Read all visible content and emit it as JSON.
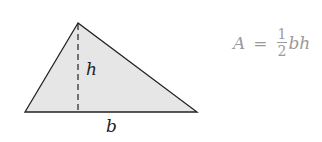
{
  "diagram": {
    "shape": {
      "type": "triangle",
      "vertices": [
        [
          78,
          23
        ],
        [
          25,
          112
        ],
        [
          197,
          112
        ]
      ],
      "fill": "#e6e6e6",
      "stroke": "#222222"
    },
    "height_line": {
      "x": 78,
      "y1": 23,
      "y2": 112,
      "style": "dashed"
    },
    "labels": {
      "height": "h",
      "base": "b"
    },
    "formula": {
      "lhs": "A",
      "equals": "=",
      "numerator": "1",
      "denominator": "2",
      "rhs": "bh",
      "color": "#9a9a9a"
    }
  }
}
